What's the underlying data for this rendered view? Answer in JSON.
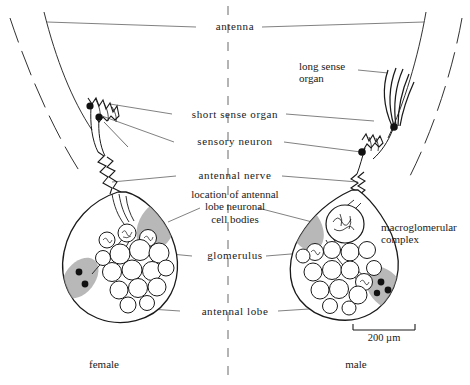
{
  "figure": {
    "title_implicit": "Moth antenna and antennal lobe: female vs male",
    "background_color": "#ffffff",
    "stroke_color": "#1a1a1a",
    "shade_color": "#9a9a9a",
    "width": 470,
    "height": 385
  },
  "center_labels": [
    {
      "id": "antenna",
      "text": "antenna",
      "x": 228,
      "y": 26
    },
    {
      "id": "short-sense",
      "text": "short sense organ",
      "x": 228,
      "y": 114
    },
    {
      "id": "sensory-neuron",
      "text": "sensory neuron",
      "x": 228,
      "y": 140
    },
    {
      "id": "antennal-nerve",
      "text": "antennal nerve",
      "x": 228,
      "y": 175
    },
    {
      "id": "glomerulus",
      "text": "glomerulus",
      "x": 228,
      "y": 255
    },
    {
      "id": "antennal-lobe",
      "text": "antennal lobe",
      "x": 228,
      "y": 310
    }
  ],
  "cell_bodies_label": {
    "line1": "location of antennal",
    "line2": "lobe neuronal",
    "line3": "cell bodies",
    "x": 228,
    "y": 196
  },
  "long_sense_label": {
    "line1": "long sense",
    "line2": "organ",
    "x": 300,
    "y": 66
  },
  "macroglomerular_label": {
    "line1": "macroglomerular",
    "line2": "complex",
    "x": 382,
    "y": 225
  },
  "sex_labels": {
    "female": "female",
    "male": "male",
    "female_x": 103,
    "male_x": 355,
    "y": 365
  },
  "scale_bar": {
    "text": "200 µm",
    "value": 200,
    "unit": "µm",
    "x_left": 353,
    "x_right": 415,
    "y": 330
  },
  "structures": {
    "female_lobe": {
      "name": "antennal lobe",
      "glomeruli_count": 13,
      "shaded_patches": 2,
      "soma_dots": 2,
      "neuron_cell_bodies": 3
    },
    "male_lobe": {
      "name": "antennal lobe",
      "glomeruli_count": 13,
      "shaded_patches": 2,
      "soma_dots": 3,
      "neuron_cell_bodies": 2,
      "macroglomerular_complex": true
    },
    "female_antenna": {
      "sense_organ_type": "short sense organ",
      "sensory_neuron_dots": 2
    },
    "male_antenna": {
      "sense_organ_type": "long sense organ",
      "sensory_neuron_dots": 2,
      "long_hairs": 5
    }
  }
}
